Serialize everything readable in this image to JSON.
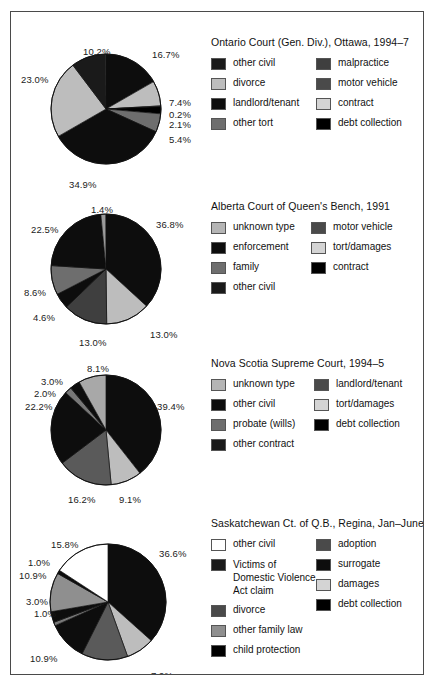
{
  "figure": {
    "border_color": "#4a4a4a",
    "background": "#ffffff"
  },
  "palette": {
    "black": "#000000",
    "near_black": "#0d0d0d",
    "dark_gray": "#3f3f3f",
    "mid_gray": "#6e6e6e",
    "light_gray": "#bdbdbd",
    "pale_gray": "#d4d4d4",
    "white": "#ffffff"
  },
  "chart_data": [
    {
      "type": "pie",
      "title": "Ontario Court (Gen. Div.), Ottawa, 1994–7",
      "categories": [
        "other civil",
        "divorce",
        "landlord/tenant",
        "other tort",
        "malpractice",
        "motor vehicle",
        "contract",
        "debt collection"
      ],
      "legend_order": [
        "other civil",
        "malpractice",
        "divorce",
        "motor vehicle",
        "landlord/tenant",
        "contract",
        "other tort",
        "debt collection"
      ],
      "labels": [
        "16.7%",
        "7.4%",
        "0.2%",
        "2.1%",
        "5.4%",
        "34.9%",
        "23.0%",
        "10.2%"
      ],
      "slices": [
        {
          "label": "16.7%",
          "value": 16.7,
          "color": "#0d0d0d"
        },
        {
          "label": "7.4%",
          "value": 7.4,
          "color": "#bdbdbd"
        },
        {
          "label": "0.2%",
          "value": 0.2,
          "color": "#ffffff"
        },
        {
          "label": "2.1%",
          "value": 2.1,
          "color": "#000000"
        },
        {
          "label": "5.4%",
          "value": 5.4,
          "color": "#6e6e6e"
        },
        {
          "label": "34.9%",
          "value": 34.9,
          "color": "#0d0d0d"
        },
        {
          "label": "23.0%",
          "value": 23.0,
          "color": "#bdbdbd"
        },
        {
          "label": "10.2%",
          "value": 10.2,
          "color": "#1a1a1a"
        }
      ],
      "legend": [
        {
          "label": "other civil",
          "color": "#1a1a1a"
        },
        {
          "label": "malpractice",
          "color": "#3f3f3f"
        },
        {
          "label": "divorce",
          "color": "#bdbdbd"
        },
        {
          "label": "motor vehicle",
          "color": "#4a4a4a"
        },
        {
          "label": "landlord/tenant",
          "color": "#0d0d0d"
        },
        {
          "label": "contract",
          "color": "#d4d4d4"
        },
        {
          "label": "other tort",
          "color": "#6e6e6e"
        },
        {
          "label": "debt collection",
          "color": "#000000"
        }
      ]
    },
    {
      "type": "pie",
      "title": "Alberta Court of Queen's Bench, 1991",
      "categories": [
        "unknown type",
        "enforcement",
        "family",
        "other civil",
        "motor vehicle",
        "tort/damages",
        "contract"
      ],
      "legend_order": [
        "unknown type",
        "motor vehicle",
        "enforcement",
        "tort/damages",
        "family",
        "contract",
        "other civil"
      ],
      "labels": [
        "36.8%",
        "13.0%",
        "13.0%",
        "4.6%",
        "8.6%",
        "22.5%",
        "1.4%"
      ],
      "slices": [
        {
          "label": "36.8%",
          "value": 36.8,
          "color": "#0d0d0d"
        },
        {
          "label": "13.0%",
          "value": 13.0,
          "color": "#bdbdbd"
        },
        {
          "label": "13.0%",
          "value": 13.0,
          "color": "#3f3f3f"
        },
        {
          "label": "4.6%",
          "value": 4.6,
          "color": "#0d0d0d"
        },
        {
          "label": "8.6%",
          "value": 8.6,
          "color": "#6e6e6e"
        },
        {
          "label": "22.5%",
          "value": 22.5,
          "color": "#0d0d0d"
        },
        {
          "label": "1.4%",
          "value": 1.4,
          "color": "#9a9a9a"
        }
      ],
      "legend": [
        {
          "label": "unknown type",
          "color": "#b5b5b5"
        },
        {
          "label": "motor vehicle",
          "color": "#4a4a4a"
        },
        {
          "label": "enforcement",
          "color": "#0d0d0d"
        },
        {
          "label": "tort/damages",
          "color": "#d4d4d4"
        },
        {
          "label": "family",
          "color": "#6e6e6e"
        },
        {
          "label": "contract",
          "color": "#000000"
        },
        {
          "label": "other civil",
          "color": "#1a1a1a"
        }
      ]
    },
    {
      "type": "pie",
      "title": "Nova Scotia Supreme Court, 1994–5",
      "categories": [
        "unknown type",
        "other civil",
        "probate (wills)",
        "other contract",
        "landlord/tenant",
        "tort/damages",
        "debt collection"
      ],
      "legend_order": [
        "unknown type",
        "landlord/tenant",
        "other civil",
        "tort/damages",
        "probate (wills)",
        "debt collection",
        "other contract"
      ],
      "labels": [
        "39.4%",
        "9.1%",
        "16.2%",
        "22.2%",
        "2.0%",
        "3.0%",
        "8.1%"
      ],
      "slices": [
        {
          "label": "39.4%",
          "value": 39.4,
          "color": "#0d0d0d"
        },
        {
          "label": "9.1%",
          "value": 9.1,
          "color": "#bdbdbd"
        },
        {
          "label": "16.2%",
          "value": 16.2,
          "color": "#5a5a5a"
        },
        {
          "label": "22.2%",
          "value": 22.2,
          "color": "#0d0d0d"
        },
        {
          "label": "2.0%",
          "value": 2.0,
          "color": "#777777"
        },
        {
          "label": "3.0%",
          "value": 3.0,
          "color": "#0d0d0d"
        },
        {
          "label": "8.1%",
          "value": 8.1,
          "color": "#a8a8a8"
        }
      ],
      "legend": [
        {
          "label": "unknown type",
          "color": "#b5b5b5"
        },
        {
          "label": "landlord/tenant",
          "color": "#4a4a4a"
        },
        {
          "label": "other civil",
          "color": "#0d0d0d"
        },
        {
          "label": "tort/damages",
          "color": "#d4d4d4"
        },
        {
          "label": "probate (wills)",
          "color": "#6e6e6e"
        },
        {
          "label": "debt collection",
          "color": "#000000"
        },
        {
          "label": "other contract",
          "color": "#1a1a1a"
        }
      ]
    },
    {
      "type": "pie",
      "title": "Saskatchewan Ct. of Q.B., Regina, Jan–June 1996",
      "categories": [
        "other civil",
        "Victims of Domestic Violence Act claim",
        "other family law",
        "child protection",
        "adoption",
        "surrogate",
        "divorce",
        "damages",
        "debt collection"
      ],
      "legend_order": [
        "other civil",
        "adoption",
        "Victims of Domestic Violence Act claim",
        "surrogate",
        "divorce",
        "damages",
        "other family law",
        "debt collection",
        "child protection"
      ],
      "labels": [
        "36.6%",
        "7.9%",
        "12.9%",
        "10.9%",
        "1.0%",
        "3.0%",
        "10.9%",
        "1.0%",
        "15.8%"
      ],
      "slices": [
        {
          "label": "36.6%",
          "value": 36.6,
          "color": "#0d0d0d"
        },
        {
          "label": "7.9%",
          "value": 7.9,
          "color": "#bdbdbd"
        },
        {
          "label": "12.9%",
          "value": 12.9,
          "color": "#5a5a5a"
        },
        {
          "label": "10.9%",
          "value": 10.9,
          "color": "#0d0d0d"
        },
        {
          "label": "1.0%",
          "value": 1.0,
          "color": "#787878"
        },
        {
          "label": "3.0%",
          "value": 3.0,
          "color": "#0d0d0d"
        },
        {
          "label": "10.9%",
          "value": 10.9,
          "color": "#8f8f8f"
        },
        {
          "label": "1.0%",
          "value": 1.0,
          "color": "#0d0d0d"
        },
        {
          "label": "15.8%",
          "value": 15.8,
          "color": "#ffffff"
        }
      ],
      "legend": [
        {
          "label": "other civil",
          "color": "#ffffff"
        },
        {
          "label": "adoption",
          "color": "#4a4a4a"
        },
        {
          "label": "Victims of Domestic Violence Act claim",
          "color": "#1a1a1a"
        },
        {
          "label": "surrogate",
          "color": "#0d0d0d"
        },
        {
          "label": "divorce",
          "color": "#4a4a4a"
        },
        {
          "label": "damages",
          "color": "#d4d4d4"
        },
        {
          "label": "other family law",
          "color": "#8f8f8f"
        },
        {
          "label": "debt collection",
          "color": "#000000"
        },
        {
          "label": "child protection",
          "color": "#000000"
        }
      ]
    }
  ]
}
